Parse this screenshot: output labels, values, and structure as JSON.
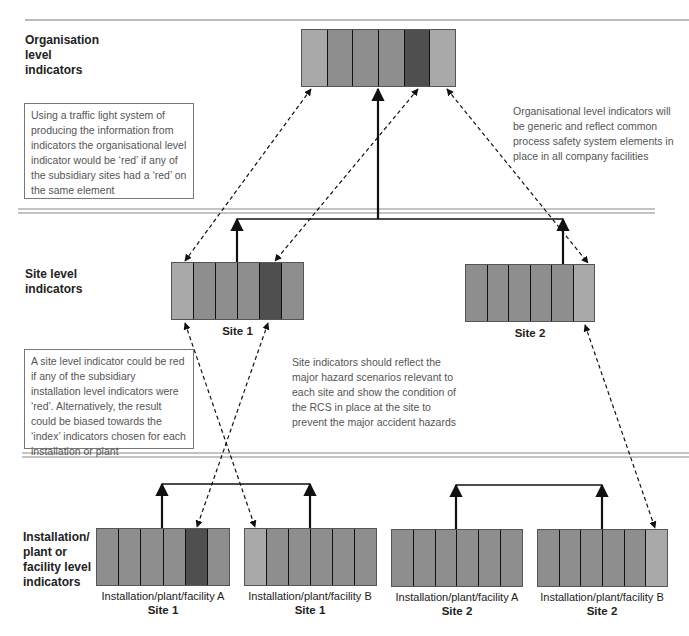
{
  "colors": {
    "cell_normal": "#8e8e8e",
    "cell_light": "#a9a9a9",
    "cell_dark": "#4f4f4f",
    "line": "#111111",
    "separator": "#888888"
  },
  "levels": {
    "organisation": "Organisation\nlevel\nindicators",
    "site": "Site level\nindicators",
    "installation": "Installation/\nplant or\nfacility level\nindicators"
  },
  "notes": {
    "traffic_light": "Using a traffic light system of producing the information from indicators the organisational level indicator would be ‘red’ if any of the subsidiary sites had a ‘red’ on the same element",
    "organisational_generic": "Organisational level indicators will be generic and reflect common process safety system elements in place in all company facilities",
    "site_red": "A site level indicator could be red if any of the subsidiary installation level indicators were ‘red’. Alternatively, the result could be biased towards the ‘index’ indicators chosen for each installation or plant",
    "site_reflect": "Site indicators should reflect the major hazard scenarios relevant to each site and show the condition of the RCS in place at the site to prevent the major accident hazards"
  },
  "indicators": {
    "organisation": {
      "cells": [
        "light",
        "normal",
        "normal",
        "normal",
        "dark",
        "light"
      ]
    },
    "site1": {
      "label": "Site 1",
      "cells": [
        "light",
        "normal",
        "normal",
        "normal",
        "dark",
        "normal"
      ]
    },
    "site2": {
      "label": "Site 2",
      "cells": [
        "normal",
        "normal",
        "normal",
        "normal",
        "normal",
        "light"
      ]
    },
    "inst_a_site1": {
      "name": "Installation/plant/facility A",
      "site": "Site 1",
      "cells": [
        "normal",
        "normal",
        "normal",
        "normal",
        "dark",
        "normal"
      ]
    },
    "inst_b_site1": {
      "name": "Installation/plant/facility B",
      "site": "Site 1",
      "cells": [
        "light",
        "normal",
        "normal",
        "normal",
        "normal",
        "normal"
      ]
    },
    "inst_a_site2": {
      "name": "Installation/plant/facility A",
      "site": "Site 2",
      "cells": [
        "normal",
        "normal",
        "normal",
        "normal",
        "normal",
        "normal"
      ]
    },
    "inst_b_site2": {
      "name": "Installation/plant/facility B",
      "site": "Site 2",
      "cells": [
        "normal",
        "normal",
        "normal",
        "normal",
        "normal",
        "light"
      ]
    }
  }
}
